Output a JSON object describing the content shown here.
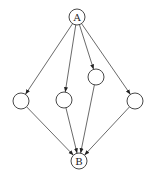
{
  "diagram": {
    "type": "directed-graph",
    "width": 155,
    "height": 180,
    "node_radius": 8,
    "nodes": [
      {
        "id": "A",
        "label": "A",
        "x": 77,
        "y": 17
      },
      {
        "id": "n1",
        "label": "",
        "x": 21,
        "y": 101
      },
      {
        "id": "n2",
        "label": "",
        "x": 64,
        "y": 100
      },
      {
        "id": "n3",
        "label": "",
        "x": 96,
        "y": 77
      },
      {
        "id": "n4",
        "label": "",
        "x": 135,
        "y": 101
      },
      {
        "id": "B",
        "label": "B",
        "x": 79,
        "y": 161
      }
    ],
    "edges": [
      {
        "from": "A",
        "to": "n1"
      },
      {
        "from": "A",
        "to": "n2"
      },
      {
        "from": "A",
        "to": "n3"
      },
      {
        "from": "A",
        "to": "n4"
      },
      {
        "from": "n1",
        "to": "B"
      },
      {
        "from": "n2",
        "to": "B"
      },
      {
        "from": "n3",
        "to": "B"
      },
      {
        "from": "n4",
        "to": "B"
      }
    ],
    "colors": {
      "stroke": "#333333",
      "fill": "#ffffff",
      "background": "#ffffff"
    }
  }
}
